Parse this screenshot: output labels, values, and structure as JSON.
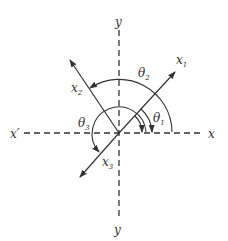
{
  "diagram": {
    "title": "",
    "axes": {
      "x": "x",
      "x_neg": "x′",
      "y_top": "y",
      "y_bottom": "y"
    },
    "rotated_axes": [
      {
        "name": "x",
        "subscript": "1",
        "angle_label": "θ",
        "angle_sub": "1"
      },
      {
        "name": "x",
        "subscript": "2",
        "angle_label": "θ",
        "angle_sub": "2"
      },
      {
        "name": "x",
        "subscript": "3",
        "angle_label": "θ",
        "angle_sub": "3"
      }
    ],
    "colors": {
      "line": "#333333",
      "background": "#ffffff"
    }
  }
}
